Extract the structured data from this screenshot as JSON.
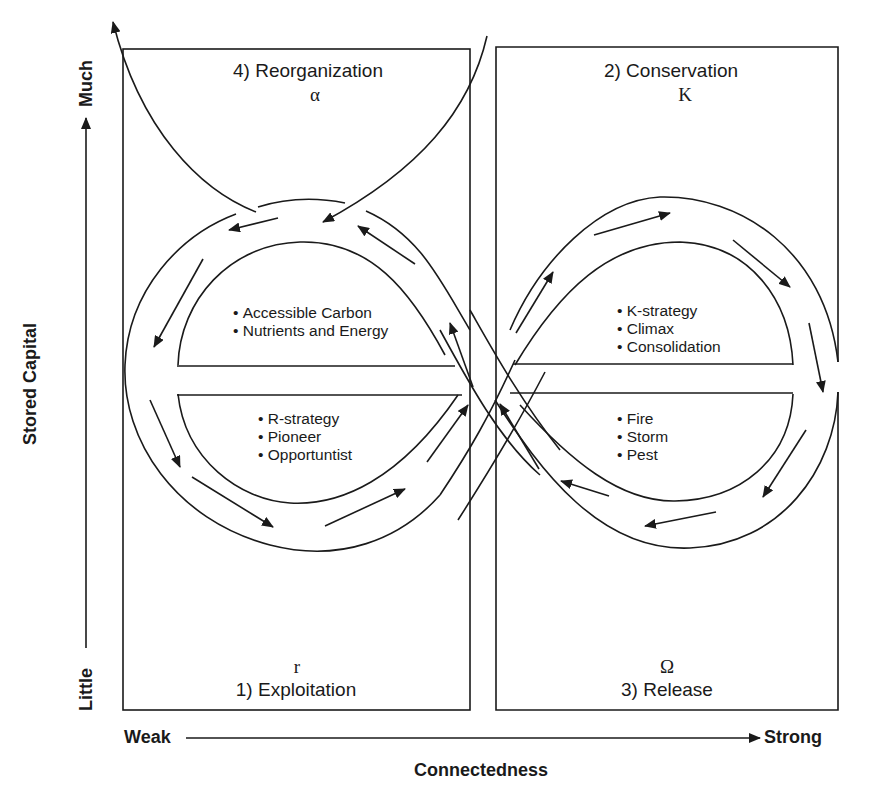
{
  "diagram": {
    "type": "adaptive-cycle",
    "axes": {
      "y": {
        "title": "Stored Capital",
        "low": "Little",
        "high": "Much"
      },
      "x": {
        "title": "Connectedness",
        "low": "Weak",
        "high": "Strong"
      }
    },
    "phases": [
      {
        "id": "reorganization",
        "label": "4)  Reorganization",
        "symbol": "α"
      },
      {
        "id": "conservation",
        "label": "2)  Conservation",
        "symbol": "K"
      },
      {
        "id": "exploitation",
        "label": "1)  Exploitation",
        "symbol": "r"
      },
      {
        "id": "release",
        "label": "3)  Release",
        "symbol": "Ω"
      }
    ],
    "loop_notes": {
      "upper_left": [
        "Accessible Carbon",
        "Nutrients and Energy"
      ],
      "lower_left": [
        "R-strategy",
        "Pioneer",
        "Opportuntist"
      ],
      "upper_right": [
        "K-strategy",
        "Climax",
        "Consolidation"
      ],
      "lower_right": [
        "Fire",
        "Storm",
        "Pest"
      ]
    },
    "colors": {
      "line": "#1a1a1a",
      "background": "#ffffff"
    }
  }
}
